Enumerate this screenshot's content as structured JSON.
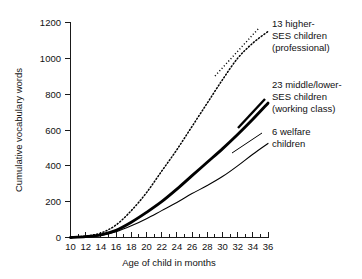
{
  "chart_data": {
    "type": "line",
    "title": "",
    "xlabel": "Age of child in months",
    "ylabel": "Cumulative vocabulary words",
    "xlim": [
      10,
      36
    ],
    "ylim": [
      0,
      1200
    ],
    "xticks": [
      10,
      12,
      14,
      16,
      18,
      20,
      22,
      24,
      26,
      28,
      30,
      32,
      34,
      36
    ],
    "xtick_labels": [
      "10",
      "12",
      "14",
      "16",
      "18",
      "20",
      "22",
      "24",
      "26",
      "28",
      "30",
      "32",
      "34",
      "36"
    ],
    "yticks": [
      0,
      200,
      400,
      600,
      800,
      1000,
      1200
    ],
    "ytick_labels": [
      "0",
      "200",
      "400",
      "600",
      "800",
      "1000",
      "1200"
    ],
    "grid": false,
    "legend_position": "inline-annotations",
    "x": [
      10,
      12,
      14,
      16,
      18,
      20,
      22,
      24,
      26,
      28,
      30,
      32,
      34,
      36
    ],
    "series": [
      {
        "name": "13 higher-SES children (professional)",
        "style": "dotted",
        "values": [
          0,
          8,
          25,
          70,
          150,
          250,
          370,
          490,
          620,
          750,
          880,
          1000,
          1085,
          1150
        ]
      },
      {
        "name": "23 middle/lower-SES children (working class)",
        "style": "thick-solid",
        "values": [
          0,
          5,
          15,
          40,
          85,
          140,
          200,
          270,
          345,
          420,
          495,
          575,
          660,
          750
        ]
      },
      {
        "name": "6 welfare children",
        "style": "thin-solid",
        "values": [
          0,
          4,
          12,
          32,
          65,
          105,
          150,
          195,
          245,
          290,
          340,
          400,
          465,
          525
        ]
      }
    ],
    "annotations": [
      {
        "id": "annotation-professional",
        "lines": [
          "13 higher-",
          "SES children",
          "(professional)"
        ],
        "leader_style": "dotted"
      },
      {
        "id": "annotation-working-class",
        "lines": [
          "23 middle/lower-",
          "SES children",
          "(working class)"
        ],
        "leader_style": "thick-solid"
      },
      {
        "id": "annotation-welfare",
        "lines": [
          "6 welfare",
          "children"
        ],
        "leader_style": "thin-solid"
      }
    ],
    "colors": {
      "axis": "#1a1a1a",
      "series": "#000000",
      "background": "#ffffff",
      "text": "#111111"
    }
  }
}
